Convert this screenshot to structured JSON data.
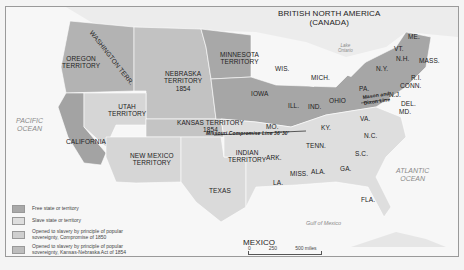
{
  "map": {
    "regions": {
      "canada": "BRITISH NORTH AMERICA\n(CANADA)",
      "mexico": "MEXICO",
      "pacific": "PACIFIC\nOCEAN",
      "atlantic": "ATLANTIC\nOCEAN",
      "gulf": "Gulf of Mexico",
      "lake_ontario": "Lake\nOntario"
    },
    "territories": {
      "washington": "WASHINGTON TERR.",
      "oregon": "OREGON\nTERRITORY",
      "minnesota": "MINNESOTA\nTERRITORY",
      "nebraska": "NEBRASKA\nTERRITORY\n1854",
      "utah": "UTAH\nTERRITORY",
      "kansas": "KANSAS TERRITORY\n1854",
      "new_mexico": "NEW MEXICO\nTERRITORY",
      "indian": "INDIAN\nTERRITORY",
      "california": "CALIFORNIA",
      "texas": "TEXAS"
    },
    "states": {
      "wis": "WIS.",
      "mich": "MICH.",
      "iowa": "IOWA",
      "ill": "ILL.",
      "ind": "IND.",
      "ohio": "OHIO",
      "mo": "MO.",
      "ky": "KY.",
      "tenn": "TENN.",
      "ark": "ARK.",
      "la": "LA.",
      "miss": "MISS.",
      "ala": "ALA.",
      "ga": "GA.",
      "sc": "S.C.",
      "nc": "N.C.",
      "va": "VA.",
      "fla": "FLA.",
      "pa": "PA.",
      "ny": "N.Y.",
      "vt": "VT.",
      "nh": "N.H.",
      "me": "ME.",
      "mass": "MASS.",
      "ri": "R.I.",
      "conn": "CONN.",
      "nj": "N.J.",
      "del": "DEL.",
      "md": "MD."
    },
    "lines": {
      "missouri": "Missouri Compromise Line 36°30'",
      "mason_dixon": "Mason and\nDixon Line"
    }
  },
  "legend": {
    "items": [
      {
        "label": "Free state or territory",
        "color": "#a9a9a9"
      },
      {
        "label": "Slave state or territory",
        "color": "#dedede"
      },
      {
        "label": "Opened to slavery by principle of popular sovereignty, Compromise of 1850",
        "color": "#cfcfcf"
      },
      {
        "label": "Opened to slavery by principle of popular sovereignty, Kansas-Nebraska Act of 1854",
        "color": "#bdbdbd"
      }
    ]
  },
  "scale": {
    "miles": [
      "0",
      "250",
      "500 miles"
    ],
    "km": [
      "0",
      "250",
      "500 kilometers"
    ]
  }
}
